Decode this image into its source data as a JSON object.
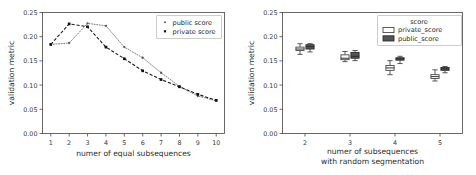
{
  "figure": {
    "background": "#ffffff",
    "panels": 2
  },
  "chart_data": [
    {
      "id": "left-line-chart",
      "type": "line",
      "title": "",
      "xlabel": "numer of equal subsequences",
      "ylabel": "validation metric",
      "x": [
        1,
        2,
        3,
        4,
        5,
        6,
        7,
        8,
        9,
        10
      ],
      "xtick_labels": [
        "1",
        "2",
        "3",
        "4",
        "5",
        "6",
        "7",
        "8",
        "9",
        "10"
      ],
      "ytick_labels": [
        "0.00",
        "0.05",
        "0.10",
        "0.15",
        "0.20",
        "0.25"
      ],
      "yticks": [
        0.0,
        0.05,
        0.1,
        0.15,
        0.2,
        0.25
      ],
      "xlim": [
        0.55,
        10.45
      ],
      "ylim": [
        0.0,
        0.25
      ],
      "grid": false,
      "legend_position": "upper right",
      "series": [
        {
          "name": "public score",
          "marker": "point",
          "linestyle": "dotted",
          "color": "#555555",
          "values": [
            0.184,
            0.187,
            0.2275,
            0.2225,
            0.1785,
            0.1565,
            0.1255,
            0.0975,
            0.0775,
            0.0675
          ]
        },
        {
          "name": "private score",
          "marker": "square",
          "linestyle": "dashed",
          "color": "#111111",
          "values": [
            0.184,
            0.2265,
            0.2205,
            0.1785,
            0.1545,
            0.1295,
            0.1115,
            0.0965,
            0.081,
            0.0685
          ]
        }
      ]
    },
    {
      "id": "right-box-chart",
      "type": "boxplot",
      "title": "",
      "xlabel_line1": "numer of subsequences",
      "xlabel_line2": "with random segmentation",
      "ylabel": "validation metric",
      "categories": [
        "2",
        "3",
        "4",
        "5"
      ],
      "xtick_labels": [
        "2",
        "3",
        "4",
        "5"
      ],
      "ytick_labels": [
        "0.00",
        "0.05",
        "0.10",
        "0.15",
        "0.20",
        "0.25"
      ],
      "yticks": [
        0.0,
        0.05,
        0.1,
        0.15,
        0.2,
        0.25
      ],
      "ylim": [
        0.0,
        0.25
      ],
      "grid": false,
      "legend_title": "score",
      "legend_position": "upper right",
      "series": [
        {
          "name": "private_score",
          "fill": "#ffffff",
          "edge": "#3c3c3c",
          "boxes": [
            {
              "category": "2",
              "whisker_low": 0.1635,
              "q1": 0.1715,
              "median": 0.1745,
              "q3": 0.1785,
              "whisker_high": 0.1855
            },
            {
              "category": "3",
              "whisker_low": 0.1485,
              "q1": 0.1525,
              "median": 0.1555,
              "q3": 0.1625,
              "whisker_high": 0.1695
            },
            {
              "category": "4",
              "whisker_low": 0.1215,
              "q1": 0.1305,
              "median": 0.1355,
              "q3": 0.1405,
              "whisker_high": 0.1505
            },
            {
              "category": "5",
              "whisker_low": 0.1085,
              "q1": 0.1135,
              "median": 0.1175,
              "q3": 0.1215,
              "whisker_high": 0.1315
            }
          ]
        },
        {
          "name": "public_score",
          "fill": "#555555",
          "edge": "#2a2a2a",
          "boxes": [
            {
              "category": "2",
              "whisker_low": 0.1685,
              "q1": 0.1745,
              "median": 0.1795,
              "q3": 0.1835,
              "whisker_high": 0.1855
            },
            {
              "category": "3",
              "whisker_low": 0.1505,
              "q1": 0.1555,
              "median": 0.1595,
              "q3": 0.1675,
              "whisker_high": 0.1715
            },
            {
              "category": "4",
              "whisker_low": 0.1445,
              "q1": 0.1515,
              "median": 0.1545,
              "q3": 0.1565,
              "whisker_high": 0.1595
            },
            {
              "category": "5",
              "whisker_low": 0.1255,
              "q1": 0.1305,
              "median": 0.1335,
              "q3": 0.1365,
              "whisker_high": 0.1385
            }
          ]
        }
      ]
    }
  ]
}
